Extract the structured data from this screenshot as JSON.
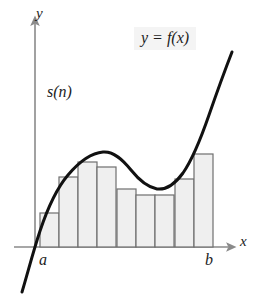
{
  "figure": {
    "background_color": "#ffffff",
    "width": 272,
    "height": 299
  },
  "labels": {
    "y_axis": "y",
    "x_axis": "x",
    "lower_limit": "a",
    "upper_limit": "b",
    "sum_label": "s(n)",
    "function_label": "y = f(x)"
  },
  "colors": {
    "axis": "#8a8a8a",
    "curve": "#111111",
    "bar_fill": "#efefef",
    "bar_stroke": "#6e6e6e",
    "text": "#1c1c1c",
    "label_box": "#f4f4f4"
  },
  "chart_data": {
    "type": "bar",
    "title": "y = f(x)",
    "subtitle": "s(n)",
    "xlabel": "x",
    "ylabel": "y",
    "categories": [
      "1",
      "2",
      "3",
      "4",
      "5",
      "6",
      "7",
      "8",
      "9"
    ],
    "values": [
      54,
      90,
      105,
      100,
      78,
      72,
      72,
      88,
      113
    ],
    "bar_tops_px": [
      213,
      177,
      162,
      167,
      189,
      195,
      195,
      179,
      154
    ],
    "bar_left_px": [
      40,
      59,
      78,
      97,
      117,
      136,
      155,
      175,
      194
    ],
    "bar_width_px": 19,
    "baseline_px": 247,
    "axis_origin_px": [
      35,
      247
    ],
    "a_x_px": 40,
    "b_x_px": 213,
    "xlim": [
      "a",
      "b"
    ],
    "ylim": [
      0,
      200
    ],
    "grid": false,
    "legend": "none",
    "series": [
      {
        "name": "inscribed/circumscribed rectangles s(n)",
        "values": [
          54,
          90,
          105,
          100,
          78,
          72,
          72,
          88,
          113
        ]
      }
    ],
    "curve": {
      "name": "y = f(x)",
      "description": "cubic-like curve rising from below the x-axis at left, local maximum near the third rectangle, local minimum near the middle-right, then rising steeply to the upper right",
      "path_points_px": [
        [
          22,
          292
        ],
        [
          30,
          262
        ],
        [
          37,
          240
        ],
        [
          45,
          218
        ],
        [
          55,
          196
        ],
        [
          66,
          178
        ],
        [
          78,
          165
        ],
        [
          90,
          156
        ],
        [
          103,
          152
        ],
        [
          116,
          156
        ],
        [
          129,
          167
        ],
        [
          142,
          179
        ],
        [
          152,
          187
        ],
        [
          160,
          189
        ],
        [
          168,
          187
        ],
        [
          178,
          179
        ],
        [
          189,
          163
        ],
        [
          200,
          139
        ],
        [
          211,
          110
        ],
        [
          222,
          80
        ],
        [
          232,
          52
        ]
      ],
      "local_max_px": [
        103,
        152
      ],
      "local_min_px": [
        158,
        189
      ]
    },
    "annotations": [
      {
        "text": "y = f(x)",
        "position_px": [
          134,
          27
        ]
      },
      {
        "text": "s(n)",
        "position_px": [
          47,
          84
        ]
      },
      {
        "text": "a",
        "position_px": [
          39,
          252
        ]
      },
      {
        "text": "b",
        "position_px": [
          205,
          252
        ]
      }
    ]
  }
}
